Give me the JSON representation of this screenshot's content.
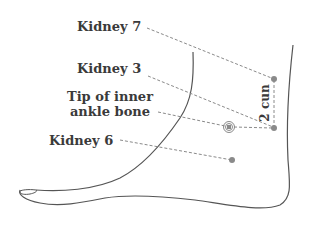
{
  "diagram": {
    "labels": {
      "kidney7": "Kidney 7",
      "kidney3": "Kidney 3",
      "ankle_line1": "Tip of inner",
      "ankle_line2": "ankle bone",
      "kidney6": "Kidney 6",
      "distance": "2 cun"
    },
    "colors": {
      "outline": "#555555",
      "point": "#8a8a8a",
      "dash": "#8a8a8a",
      "text": "#3a3a3a"
    }
  }
}
